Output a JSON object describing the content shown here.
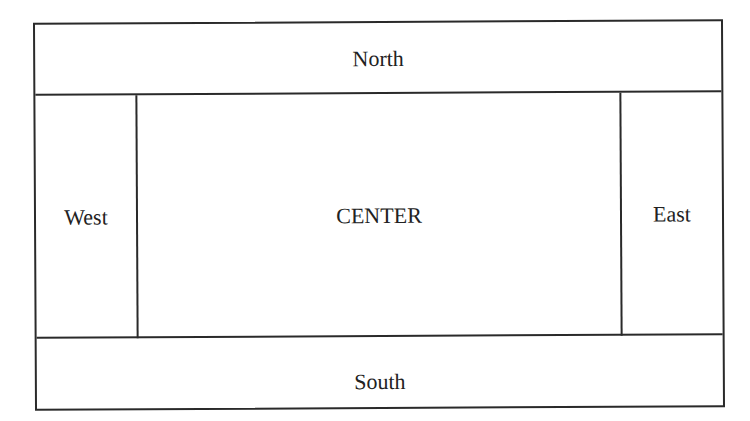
{
  "diagram": {
    "regions": {
      "north": "North",
      "south": "South",
      "west": "West",
      "east": "East",
      "center": "CENTER"
    },
    "colors": {
      "line": "#2a2a2a",
      "text": "#222222",
      "background": "#ffffff"
    }
  }
}
